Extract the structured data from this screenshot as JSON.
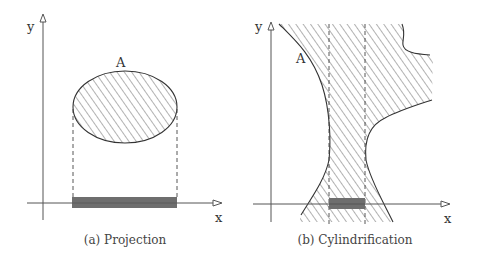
{
  "figure": {
    "panels": [
      {
        "id": "a",
        "caption": "(a) Projection",
        "x_axis_label": "x",
        "y_axis_label": "y",
        "set_label": "A",
        "shape": "ellipse",
        "description": "Hatched ellipse A projected onto the x-axis; dashed vertical lines drop from its leftmost and rightmost points to a gray bar on the x-axis."
      },
      {
        "id": "b",
        "caption": "(b) Cylindrification",
        "x_axis_label": "x",
        "y_axis_label": "y",
        "set_label": "A",
        "shape": "unbounded hatched region",
        "description": "Hatched region A extending vertically; two dashed vertical lines bound a gray interval on the x-axis."
      }
    ],
    "colors": {
      "line": "#333333",
      "hatch": "#555555",
      "projection_bar": "#6e6e6e",
      "background": "#ffffff"
    }
  }
}
